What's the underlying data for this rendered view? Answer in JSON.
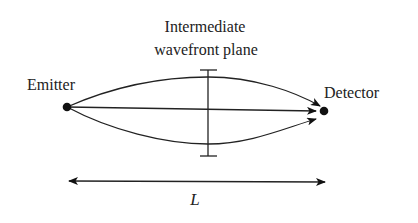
{
  "diagram": {
    "plane_label_line1": "Intermediate",
    "plane_label_line2": "wavefront plane",
    "emitter_label": "Emitter",
    "detector_label": "Detector",
    "distance_label": "L",
    "colors": {
      "ink": "#222222",
      "background": "#ffffff"
    },
    "paths": [
      {
        "name": "upper-path",
        "from": "Emitter",
        "to": "Detector",
        "shape": "curved-up"
      },
      {
        "name": "direct-path",
        "from": "Emitter",
        "to": "Detector",
        "shape": "straight"
      },
      {
        "name": "lower-path",
        "from": "Emitter",
        "to": "Detector",
        "shape": "curved-down"
      }
    ]
  }
}
